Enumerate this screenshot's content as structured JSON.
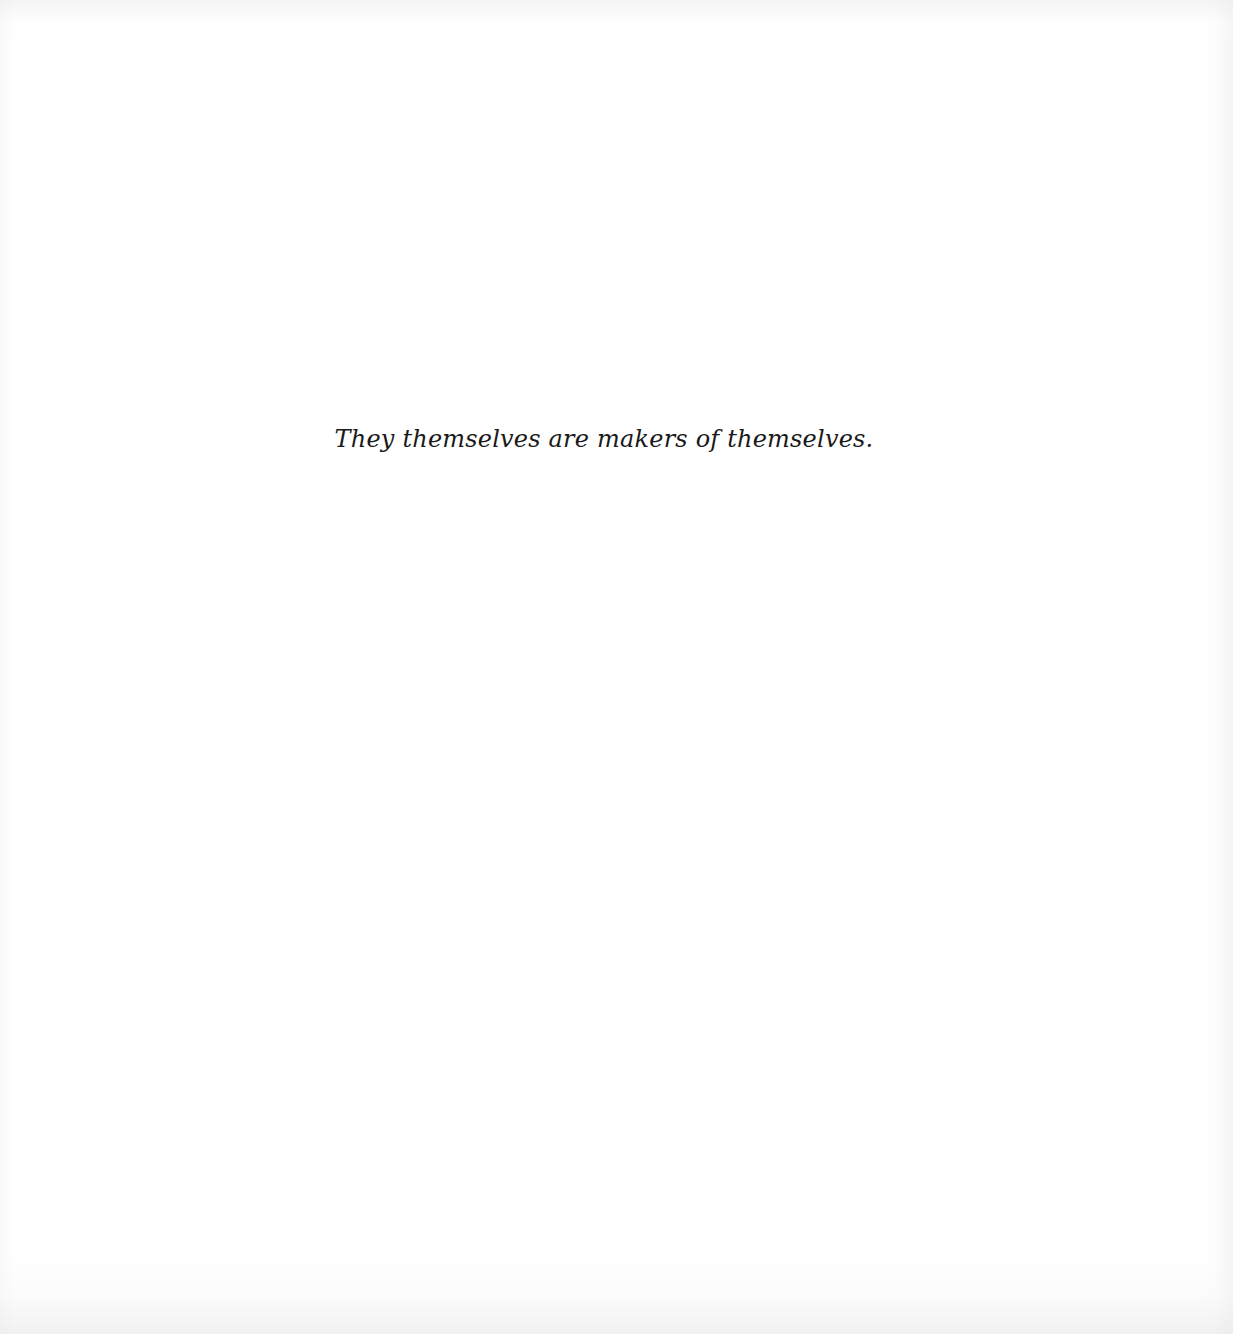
{
  "page": {
    "background_color": "#ffffff",
    "text_color": "#1a1a1a",
    "epigraph": "They themselves are makers of themselves."
  }
}
